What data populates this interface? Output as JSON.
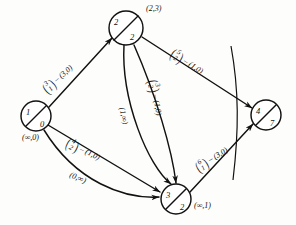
{
  "figure": {
    "type": "network-flow-graph",
    "ink_color": "#111111",
    "background": "#fdfdfb"
  },
  "nodes": [
    {
      "id": "n1",
      "upper": "1",
      "lower": "0",
      "tag": "(∞,0)",
      "cx": 36,
      "cy": 116,
      "r": 15,
      "tag_x": 22,
      "tag_y": 133
    },
    {
      "id": "n2",
      "upper": "2",
      "lower": "2",
      "tag": "(2,3)",
      "cx": 126,
      "cy": 28,
      "r": 17,
      "tag_x": 146,
      "tag_y": 4
    },
    {
      "id": "n3",
      "upper": "3",
      "lower": "2",
      "tag": "(∞,1)",
      "cx": 176,
      "cy": 199,
      "r": 15,
      "tag_x": 194,
      "tag_y": 201
    },
    {
      "id": "n4",
      "upper": "4",
      "lower": "7",
      "tag": "",
      "cx": 266,
      "cy": 115,
      "r": 15,
      "tag_x": 0,
      "tag_y": 0
    }
  ],
  "edges": [
    {
      "id": "e31",
      "from": "n1",
      "to": "n2",
      "index_top": "3",
      "index_bottom": "1",
      "flow_cap": "(3,0)",
      "label_x": 44,
      "label_y": 84,
      "label_rot": -41
    },
    {
      "id": "e52",
      "from": "n2",
      "to": "n4",
      "index_top": "5",
      "index_bottom": "2",
      "flow_cap": "(1,0)",
      "label_x": 171,
      "label_y": 45,
      "label_rot": 33
    },
    {
      "id": "e32",
      "from": "n2",
      "to": "n3",
      "index_top": "3",
      "index_bottom": "2",
      "flow_cap": "(1,0)",
      "label_x": 152,
      "label_y": 72,
      "label_rot": 80
    },
    {
      "id": "e1inf",
      "from": "n2",
      "to": "n3",
      "index_top": "",
      "index_bottom": "",
      "flow_cap": "(1,∞)",
      "label_x": 122,
      "label_y": 103,
      "label_rot": 78
    },
    {
      "id": "e42",
      "from": "n1",
      "to": "n3",
      "index_top": "4",
      "index_bottom": "2",
      "flow_cap": "(1,0)",
      "label_x": 66,
      "label_y": 135,
      "label_rot": 26
    },
    {
      "id": "e0inf",
      "from": "n1",
      "to": "n3",
      "index_top": "",
      "index_bottom": "",
      "flow_cap": "(0,∞)",
      "label_x": 70,
      "label_y": 170,
      "label_rot": 22
    },
    {
      "id": "e61",
      "from": "n3",
      "to": "n4",
      "index_top": "6",
      "index_bottom": "1",
      "flow_cap": "(3,0)",
      "label_x": 196,
      "label_y": 162,
      "label_rot": -32
    }
  ],
  "separator": {
    "name": "cut-line",
    "path": "M 231 46 C 239 90, 239 130, 233 180"
  }
}
